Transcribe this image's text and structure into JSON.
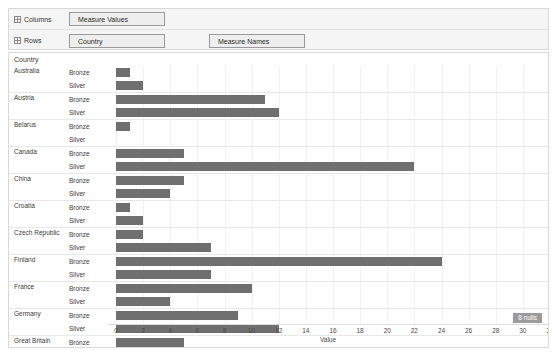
{
  "shelves": {
    "columns": {
      "label": "Columns",
      "icon": "grid-icon",
      "pills": [
        "Measure Values"
      ]
    },
    "rows": {
      "label": "Rows",
      "icon": "grid-icon",
      "pills": [
        "Country",
        "Measure Names"
      ]
    }
  },
  "viz": {
    "corner_header": "Country",
    "nulls_badge": "8 nulls",
    "bar_color": "#6f6f6f"
  },
  "chart_data": {
    "type": "bar",
    "orientation": "horizontal",
    "title": "",
    "xlabel": "Value",
    "ylabel": "Country",
    "xlim": [
      0,
      32
    ],
    "xticks": [
      0,
      2,
      4,
      6,
      8,
      10,
      12,
      14,
      16,
      18,
      20,
      22,
      24,
      26,
      28,
      30,
      32
    ],
    "grid": true,
    "legend": "none",
    "measure_names": [
      "Bronze",
      "Silver"
    ],
    "categories": [
      "Australia",
      "Austria",
      "Belarus",
      "Canada",
      "China",
      "Croatia",
      "Czech Republic",
      "Finland",
      "France",
      "Germany",
      "Great Britain",
      "Italy"
    ],
    "series": [
      {
        "name": "Bronze",
        "values": [
          1,
          11,
          1,
          5,
          5,
          1,
          2,
          24,
          10,
          9,
          5,
          12
        ]
      },
      {
        "name": "Silver",
        "values": [
          2,
          12,
          0,
          22,
          4,
          2,
          7,
          7,
          4,
          12,
          4,
          null
        ]
      }
    ],
    "rows": [
      {
        "country": "Australia",
        "metric": "Bronze",
        "value": 1
      },
      {
        "country": "Australia",
        "metric": "Silver",
        "value": 2
      },
      {
        "country": "Austria",
        "metric": "Bronze",
        "value": 11
      },
      {
        "country": "Austria",
        "metric": "Silver",
        "value": 12
      },
      {
        "country": "Belarus",
        "metric": "Bronze",
        "value": 1
      },
      {
        "country": "Belarus",
        "metric": "Silver",
        "value": 0
      },
      {
        "country": "Canada",
        "metric": "Bronze",
        "value": 5
      },
      {
        "country": "Canada",
        "metric": "Silver",
        "value": 22
      },
      {
        "country": "China",
        "metric": "Bronze",
        "value": 5
      },
      {
        "country": "China",
        "metric": "Silver",
        "value": 4
      },
      {
        "country": "Croatia",
        "metric": "Bronze",
        "value": 1
      },
      {
        "country": "Croatia",
        "metric": "Silver",
        "value": 2
      },
      {
        "country": "Czech Republic",
        "metric": "Bronze",
        "value": 2
      },
      {
        "country": "Czech Republic",
        "metric": "Silver",
        "value": 7
      },
      {
        "country": "Finland",
        "metric": "Bronze",
        "value": 24
      },
      {
        "country": "Finland",
        "metric": "Silver",
        "value": 7
      },
      {
        "country": "France",
        "metric": "Bronze",
        "value": 10
      },
      {
        "country": "France",
        "metric": "Silver",
        "value": 4
      },
      {
        "country": "Germany",
        "metric": "Bronze",
        "value": 9
      },
      {
        "country": "Germany",
        "metric": "Silver",
        "value": 12
      },
      {
        "country": "Great Britain",
        "metric": "Bronze",
        "value": 5
      },
      {
        "country": "Great Britain",
        "metric": "Silver",
        "value": 4
      },
      {
        "country": "Italy",
        "metric": "Bronze",
        "value": 12
      }
    ]
  }
}
